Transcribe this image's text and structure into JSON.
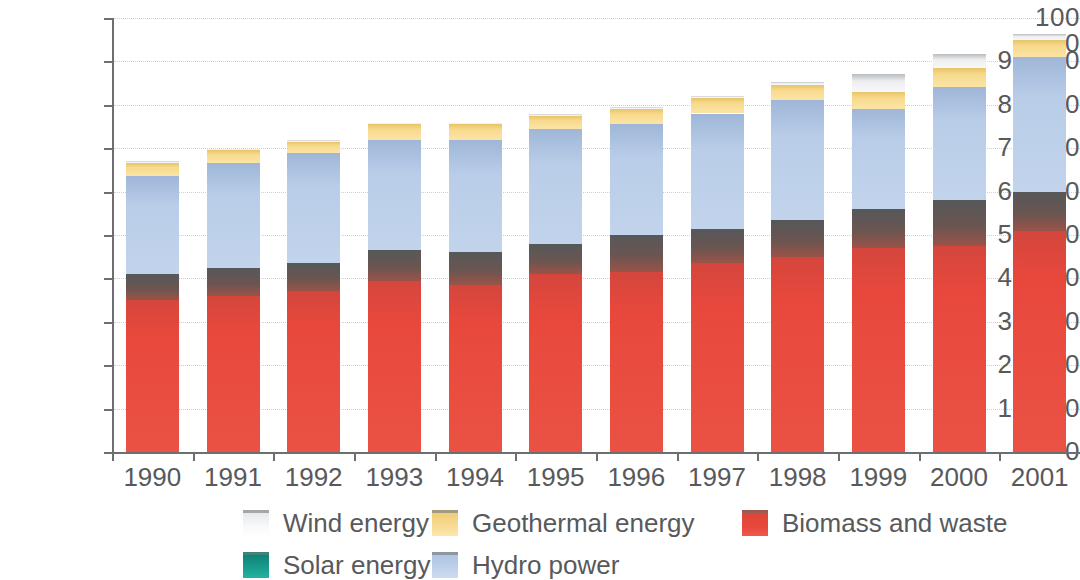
{
  "chart_data": {
    "type": "bar",
    "stacked": true,
    "title": "",
    "subtitle": "",
    "xlabel": "",
    "ylabel": "",
    "grid": true,
    "legend_position": "bottom",
    "ylim": [
      0,
      100000
    ],
    "ytick_values": [
      0,
      10000,
      20000,
      30000,
      40000,
      50000,
      60000,
      70000,
      80000,
      90000,
      100000
    ],
    "ytick_labels": [
      "0",
      "10 000",
      "20 000",
      "30 000",
      "40 000",
      "50 000",
      "60 000",
      "70 000",
      "80 000",
      "90 000",
      "100 000"
    ],
    "categories": [
      "1990",
      "1991",
      "1992",
      "1993",
      "1994",
      "1995",
      "1996",
      "1997",
      "1998",
      "1999",
      "2000",
      "2001"
    ],
    "series": [
      {
        "name": "Biomass and waste",
        "color": "#e8483c",
        "values": [
          35000,
          36000,
          37000,
          39500,
          38500,
          41000,
          41500,
          43500,
          45000,
          47000,
          47500,
          51000
        ]
      },
      {
        "name": "Solar energy",
        "color": "#1a9e8f",
        "values": [
          6000,
          6500,
          6500,
          7000,
          7500,
          7000,
          8500,
          8000,
          8500,
          9000,
          10500,
          9000
        ]
      },
      {
        "name": "Hydro power",
        "color": "#b9cde8",
        "values": [
          22500,
          24000,
          25500,
          25500,
          26000,
          26500,
          25500,
          26500,
          27500,
          23000,
          26000,
          31000
        ]
      },
      {
        "name": "Geothermal energy",
        "color": "#f5d27a",
        "values": [
          3200,
          3000,
          2500,
          3500,
          3500,
          3000,
          3500,
          3500,
          3500,
          4000,
          4500,
          4000
        ]
      },
      {
        "name": "Wind energy",
        "color": "#f2f4f6",
        "values": [
          300,
          300,
          300,
          400,
          400,
          500,
          500,
          600,
          700,
          4000,
          3200,
          1300
        ]
      }
    ],
    "totals": [
      67000,
      69800,
      71800,
      75900,
      75900,
      78000,
      79500,
      82100,
      85200,
      87000,
      91700,
      96300
    ],
    "stack_order_bottom_to_top": [
      "Biomass and waste",
      "Solar energy",
      "Hydro power",
      "Geothermal energy",
      "Wind energy"
    ],
    "note_dark_band": "Band above biomass rendered dark due to source image shading"
  },
  "legend": {
    "items": [
      {
        "label": "Wind energy",
        "swatch": "sw-wind",
        "icon": "legend-swatch-icon"
      },
      {
        "label": "Geothermal energy",
        "swatch": "sw-geothermal",
        "icon": "legend-swatch-icon"
      },
      {
        "label": "Biomass and waste",
        "swatch": "sw-biomass",
        "icon": "legend-swatch-icon"
      },
      {
        "label": "Solar energy",
        "swatch": "sw-solar",
        "icon": "legend-swatch-icon"
      },
      {
        "label": "Hydro power",
        "swatch": "sw-hydro",
        "icon": "legend-swatch-icon"
      }
    ]
  }
}
